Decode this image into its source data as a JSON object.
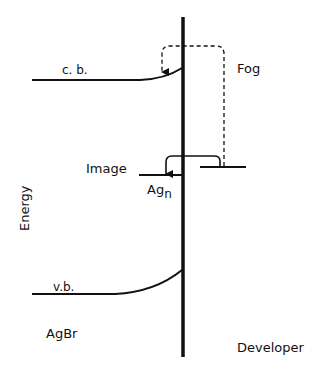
{
  "labels": {
    "cb": "c. b.",
    "vb": "v.b.",
    "fog": "Fog",
    "image": "Image",
    "ag": "Ag",
    "ag_sub": "n",
    "energy": "Energy",
    "agbr": "AgBr",
    "developer": "Developer"
  },
  "colors": {
    "line": "#111111",
    "background": "#ffffff"
  }
}
